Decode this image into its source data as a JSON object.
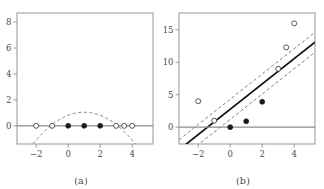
{
  "figure": {
    "background_color": "#ffffff",
    "frame_color": "#8c8c8c",
    "axis_line_color": "#8c8c8c",
    "text_color": "#4a4a4a",
    "marker_edge_color": "#3a3a3a",
    "marker_fill_open": "#ffffff",
    "marker_fill_closed": "#1a1a1a"
  },
  "panels": [
    {
      "id": "a",
      "caption": "(a)",
      "chart_data": {
        "type": "scatter",
        "title": "",
        "xlabel": "",
        "ylabel": "",
        "xlim": [
          -3.2,
          5.3
        ],
        "ylim": [
          -1.4,
          8.7
        ],
        "xticks": [
          -2,
          0,
          2,
          4
        ],
        "xtick_labels": [
          "−2",
          "0",
          "2",
          "4"
        ],
        "yticks": [
          0,
          2,
          4,
          6,
          8
        ],
        "ytick_labels": [
          "0",
          "2",
          "4",
          "6",
          "8"
        ],
        "grid": false,
        "legend": "none",
        "series": [
          {
            "name": "open-points",
            "marker": "open-circle",
            "x": [
              -2,
              -1,
              3,
              3.5,
              4
            ],
            "y": [
              0,
              0,
              0,
              0,
              0
            ]
          },
          {
            "name": "filled-points",
            "marker": "filled-circle",
            "x": [
              0,
              1,
              2
            ],
            "y": [
              0,
              0,
              0
            ]
          },
          {
            "name": "fitted-parabola",
            "marker": "none",
            "line_style": "dashed",
            "curve": "quadratic",
            "vertex": [
              1,
              1.05
            ],
            "roots": [
              -1.1,
              3.1
            ]
          },
          {
            "name": "zero-line",
            "marker": "none",
            "line_style": "solid",
            "y_constant": 0
          }
        ]
      }
    },
    {
      "id": "b",
      "caption": "(b)",
      "chart_data": {
        "type": "scatter",
        "title": "",
        "xlabel": "",
        "ylabel": "",
        "xlim": [
          -3.2,
          5.3
        ],
        "ylim": [
          -2.6,
          17.6
        ],
        "xticks": [
          -2,
          0,
          2,
          4
        ],
        "xtick_labels": [
          "−2",
          "0",
          "2",
          "4"
        ],
        "yticks": [
          0,
          5,
          10,
          15
        ],
        "ytick_labels": [
          "0",
          "5",
          "10",
          "15"
        ],
        "grid": false,
        "legend": "none",
        "series": [
          {
            "name": "open-points",
            "marker": "open-circle",
            "x": [
              -2,
              -1,
              3,
              3.5,
              4
            ],
            "y": [
              4,
              1,
              9,
              12.3,
              16
            ]
          },
          {
            "name": "filled-points",
            "marker": "filled-circle",
            "x": [
              0,
              1,
              2
            ],
            "y": [
              0,
              0.9,
              3.9
            ]
          },
          {
            "name": "regression-line",
            "marker": "none",
            "line_style": "solid",
            "slope": 1.95,
            "intercept": 2.75
          },
          {
            "name": "confidence-band-upper",
            "marker": "none",
            "line_style": "dashed",
            "slope": 1.95,
            "intercept": 4.3
          },
          {
            "name": "confidence-band-lower",
            "marker": "none",
            "line_style": "dashed",
            "slope": 1.95,
            "intercept": 1.2
          },
          {
            "name": "zero-line",
            "marker": "none",
            "line_style": "solid",
            "y_constant": 0
          }
        ]
      }
    }
  ]
}
